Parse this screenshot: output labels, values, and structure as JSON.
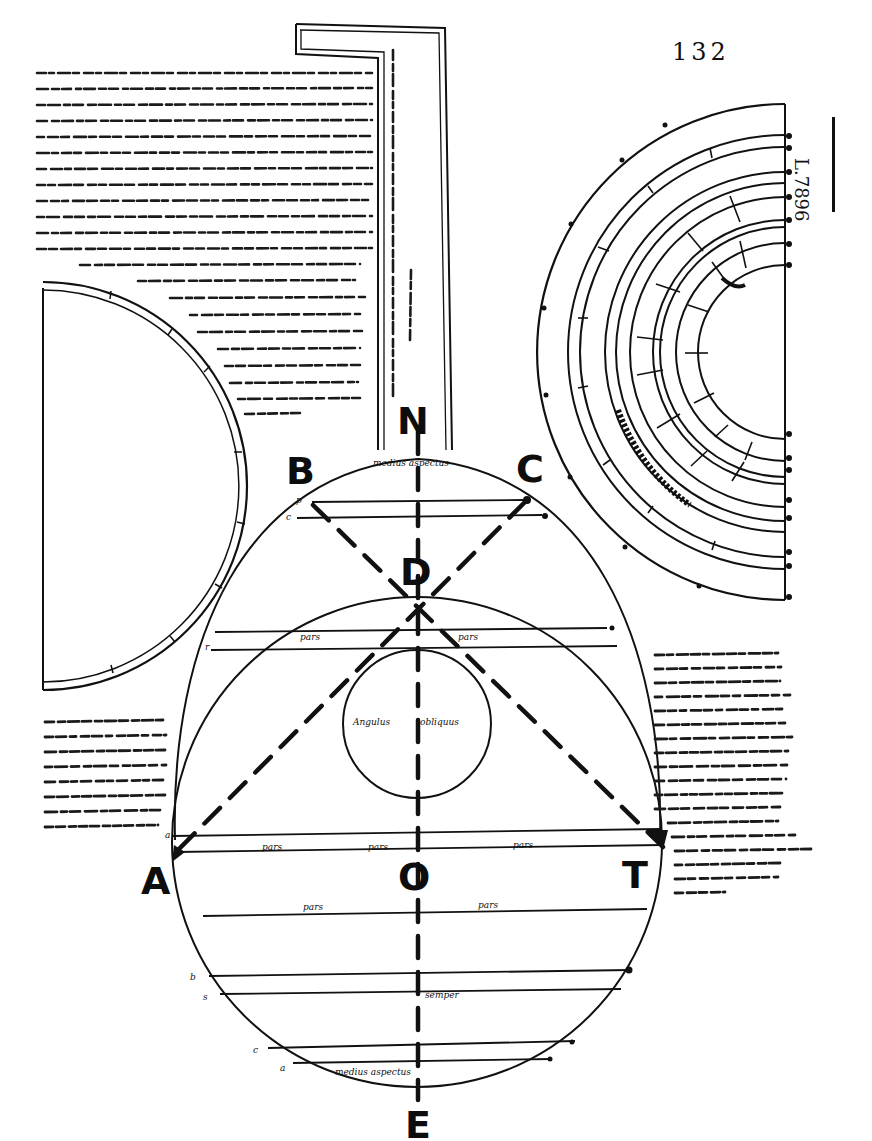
{
  "page": {
    "folio_number": "132",
    "shelfmark": "L.7896",
    "ink_color": "#111111",
    "paper_color": "#ffffff"
  },
  "main_figure": {
    "point_labels": {
      "N": "N",
      "B": "B",
      "C": "C",
      "D": "D",
      "A": "A",
      "O": "O",
      "T": "T",
      "E": "E"
    },
    "annotations": {
      "top_cap": "medius aspectus",
      "upper_band_left": "pars",
      "upper_band_right": "pars",
      "inner_circle_left": "Angulus",
      "inner_circle_right": "obliquus",
      "diameter_left": "pars",
      "diameter_center": "pars",
      "diameter_right": "pars",
      "lower_band_left": "pars",
      "lower_band_right": "pars",
      "lower_center": "semper",
      "bottom_cap": "medius aspectus"
    },
    "margin_letters": [
      "p",
      "c",
      "r",
      "a",
      "b",
      "s",
      "c",
      "a"
    ]
  },
  "text_blocks": {
    "top_left": {
      "label": "Latin commentary (upper left)",
      "line_count": 22
    },
    "vertical_column": {
      "label": "Vertical marginal note",
      "line_count": 2
    },
    "right_margin": {
      "label": "Latin commentary (right margin)",
      "line_count": 19
    },
    "left_margin": {
      "label": "Latin commentary (left margin)",
      "line_count": 8
    }
  },
  "side_figures": {
    "left_semicircle": {
      "label": "Bordered semicircle, left"
    },
    "right_concentric": {
      "label": "Concentric semicircular rings, right"
    }
  }
}
